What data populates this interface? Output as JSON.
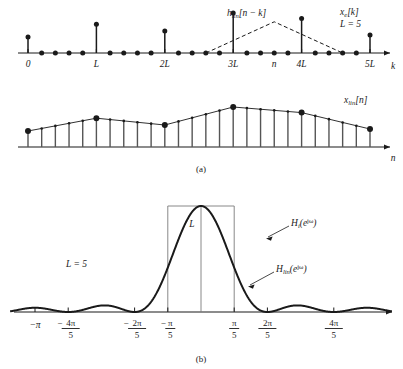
{
  "figure": {
    "caption_a": "(a)",
    "caption_b": "(b)",
    "upsample_factor": 5,
    "L_value_label": "L = 5"
  },
  "panel_a": {
    "top_plot": {
      "signal_label": "x",
      "signal_label_sub": "e",
      "signal_label_tail": "[k]",
      "params_label": "L = 5",
      "kernel_label": "h",
      "kernel_label_sub": "lin",
      "kernel_label_tail": "[n − k]",
      "xaxis_label": "k",
      "xtick_labels": [
        "0",
        "L",
        "2L",
        "3L",
        "n",
        "4L",
        "5L"
      ],
      "description": "expanded sequence with zeros between every L-th sample",
      "stem_values": [
        0.4,
        0.72,
        0.55,
        1.0,
        0.86,
        0.45
      ],
      "stem_positions_k": [
        0,
        5,
        10,
        15,
        20,
        25
      ],
      "zero_sample_count_between": 4,
      "kernel_peak_position_n": 18,
      "kernel_halfwidth_samples": 5
    },
    "bottom_plot": {
      "signal_label": "x",
      "signal_label_sub": "lin",
      "signal_label_tail": "[n]",
      "xaxis_label": "n",
      "description": "linearly interpolated output; large dots at original sample instants",
      "knot_values": [
        0.4,
        0.72,
        0.55,
        1.0,
        0.86,
        0.45
      ],
      "knot_positions_n": [
        0,
        5,
        10,
        15,
        20,
        25
      ]
    }
  },
  "panel_b": {
    "params_label": "L = 5",
    "amplitude_label": "L",
    "ideal_label": "H",
    "ideal_label_sub": "i",
    "ideal_label_tail": "(e",
    "ideal_label_exp": "jω",
    "ideal_label_close": ")",
    "linear_label": "H",
    "linear_label_sub": "lin",
    "linear_label_tail": "(e",
    "linear_label_exp": "jω",
    "linear_label_close": ")",
    "xtick_labels": [
      {
        "text": "−π",
        "type": "plain",
        "omega_over_pi": -1.0
      },
      {
        "text": "−4π/5",
        "type": "fraction",
        "sign": "−",
        "num": "4π",
        "den": "5",
        "omega_over_pi": -0.8
      },
      {
        "text": "−2π/5",
        "type": "fraction",
        "sign": "−",
        "num": "2π",
        "den": "5",
        "omega_over_pi": -0.4
      },
      {
        "text": "−π/5",
        "type": "fraction",
        "sign": "−",
        "num": "π",
        "den": "5",
        "omega_over_pi": -0.2
      },
      {
        "text": "π/5",
        "type": "fraction",
        "sign": "",
        "num": "π",
        "den": "5",
        "omega_over_pi": 0.2
      },
      {
        "text": "2π/5",
        "type": "fraction",
        "sign": "",
        "num": "2π",
        "den": "5",
        "omega_over_pi": 0.4
      },
      {
        "text": "4π/5",
        "type": "fraction",
        "sign": "",
        "num": "4π",
        "den": "5",
        "omega_over_pi": 0.8
      }
    ],
    "ideal_response": {
      "type": "rectangle",
      "height_L": 5,
      "cutoff_omega_over_pi": 0.2,
      "description": "ideal lowpass interpolation filter, gain L in passband |w| < pi/L"
    },
    "linear_response": {
      "type": "dirichlet_squared",
      "peak_value_L": 5,
      "nulls_omega_over_pi": [
        -0.8,
        -0.4,
        0.4,
        0.8
      ],
      "description": "magnitude of (1/L)*(sin(wL/2)/sin(w/2))^2 with L=5",
      "omega_range_over_pi": [
        -1.15,
        1.15
      ]
    }
  },
  "chart_data": {
    "type": "line",
    "title": "",
    "xlabel": "ω",
    "ylabel": "",
    "panels": [
      {
        "name": "x_e[k] expanded sequence",
        "type": "stem",
        "x": [
          0,
          5,
          10,
          15,
          20,
          25
        ],
        "values": [
          0.4,
          0.72,
          0.55,
          1.0,
          0.86,
          0.45
        ],
        "xticks": [
          "0",
          "L",
          "2L",
          "3L",
          "n",
          "4L",
          "5L"
        ]
      },
      {
        "name": "x_lin[n] interpolated sequence",
        "type": "stem",
        "x": [
          0,
          5,
          10,
          15,
          20,
          25
        ],
        "values": [
          0.4,
          0.72,
          0.55,
          1.0,
          0.86,
          0.45
        ]
      },
      {
        "name": "H_i(e^jw) and H_lin(e^jw)",
        "type": "line",
        "xlim": [
          -1.15,
          1.15
        ],
        "ylim": [
          0,
          5.6
        ],
        "series": [
          {
            "name": "H_i(e^jw)",
            "shape": "rectangle",
            "height": 5,
            "cutoff": 0.2
          },
          {
            "name": "H_lin(e^jw)",
            "shape": "dirichlet_squared",
            "peak": 5,
            "L": 5
          }
        ],
        "xticks": [
          -1.0,
          -0.8,
          -0.4,
          -0.2,
          0.2,
          0.4,
          0.8
        ],
        "xticklabels": [
          "−π",
          "−4π/5",
          "−2π/5",
          "−π/5",
          "π/5",
          "2π/5",
          "4π/5"
        ]
      }
    ]
  }
}
